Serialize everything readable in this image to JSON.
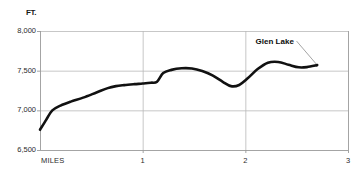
{
  "chart_data": {
    "type": "line",
    "title": "",
    "subtitle": "",
    "xlabel": "MILES",
    "ylabel": "FT.",
    "xlim": [
      0,
      3
    ],
    "ylim": [
      6500,
      8000
    ],
    "grid": true,
    "legend_position": "none",
    "x_ticks": [
      "1",
      "2",
      "3"
    ],
    "x_tick_values": [
      1,
      2,
      3
    ],
    "y_ticks": [
      "6,500",
      "7,000",
      "7,500",
      "8,000"
    ],
    "y_tick_values": [
      6500,
      7000,
      7500,
      8000
    ],
    "series": [
      {
        "name": "Elevation profile",
        "color": "#111111",
        "x": [
          0.0,
          0.06,
          0.12,
          0.2,
          0.3,
          0.42,
          0.55,
          0.66,
          0.74,
          0.82,
          0.92,
          1.0,
          1.08,
          1.14,
          1.2,
          1.28,
          1.38,
          1.48,
          1.58,
          1.68,
          1.78,
          1.86,
          1.94,
          2.02,
          2.12,
          2.22,
          2.32,
          2.42,
          2.52,
          2.6,
          2.7
        ],
        "y": [
          6755,
          6880,
          7000,
          7060,
          7110,
          7160,
          7225,
          7280,
          7305,
          7318,
          7330,
          7338,
          7348,
          7360,
          7470,
          7510,
          7530,
          7527,
          7495,
          7440,
          7360,
          7305,
          7320,
          7400,
          7520,
          7600,
          7610,
          7575,
          7542,
          7545,
          7570
        ]
      }
    ],
    "annotations": [
      {
        "text": "Glen Lake",
        "label_x": 2.1,
        "label_y": 7860,
        "point_x": 2.7,
        "point_y": 7570
      }
    ]
  }
}
